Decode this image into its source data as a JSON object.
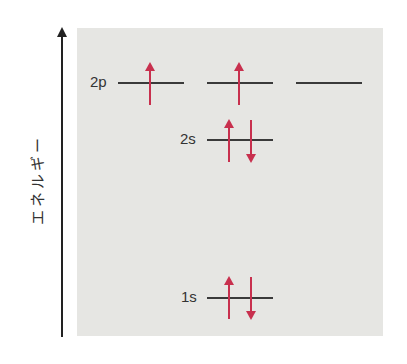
{
  "diagram": {
    "axis_label": "エネルギー",
    "colors": {
      "panel": "#e6e6e3",
      "line": "#3a3a3a",
      "electron": "#c8304e"
    },
    "levels": [
      {
        "label": "2p",
        "orbitals": [
          {
            "electrons": [
              "up"
            ]
          },
          {
            "electrons": [
              "up"
            ]
          },
          {
            "electrons": []
          }
        ]
      },
      {
        "label": "2s",
        "orbitals": [
          {
            "electrons": [
              "up",
              "down"
            ]
          }
        ]
      },
      {
        "label": "1s",
        "orbitals": [
          {
            "electrons": [
              "up",
              "down"
            ]
          }
        ]
      }
    ]
  }
}
